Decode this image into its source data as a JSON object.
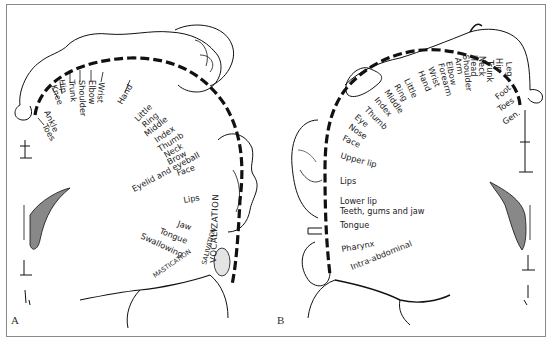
{
  "figure": {
    "panels": [
      {
        "letter": "A",
        "title": "Motor homunculus",
        "labels": [
          "Toes",
          "Ankle",
          "Knee",
          "Hip",
          "Trunk",
          "Shoulder",
          "Elbow",
          "Wrist",
          "Hand",
          "Little",
          "Ring",
          "Middle",
          "Index",
          "Thumb",
          "Neck",
          "Brow",
          "Eyelid and eyeball",
          "Face",
          "Lips",
          "Jaw",
          "Tongue",
          "Swallowing"
        ],
        "vertical_labels": [
          "VOCALIZATION",
          "SALIVATION",
          "MASTICATION"
        ]
      },
      {
        "letter": "B",
        "title": "Sensory homunculus",
        "labels": [
          "Gen.",
          "Toes",
          "Foot",
          "Leg",
          "Hip",
          "Trunk",
          "Neck",
          "Head",
          "Shoulder",
          "Arm",
          "Elbow",
          "Forearm",
          "Wrist",
          "Hand",
          "Little",
          "Ring",
          "Middle",
          "Index",
          "Thumb",
          "Eye",
          "Nose",
          "Face",
          "Upper lip",
          "Lips",
          "Lower lip",
          "Teeth, gums and jaw",
          "Tongue",
          "Pharynx",
          "Intra-abdominal"
        ]
      }
    ],
    "colors": {
      "line": "#111111",
      "border": "#8a8a8a",
      "text": "#222222"
    }
  }
}
